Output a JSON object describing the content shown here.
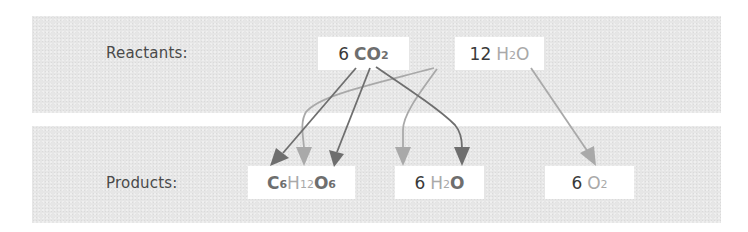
{
  "diagram": {
    "rows": {
      "reactants_label": "Reactants:",
      "products_label": "Products:"
    },
    "reactants": [
      {
        "id": "co2",
        "coefficient": "6",
        "parts": [
          {
            "symbol": "C",
            "sub": "",
            "tone": "dark"
          },
          {
            "symbol": "O",
            "sub": "2",
            "tone": "dark"
          }
        ]
      },
      {
        "id": "h2o",
        "coefficient": "12",
        "parts": [
          {
            "symbol": "H",
            "sub": "2",
            "tone": "light"
          },
          {
            "symbol": "O",
            "sub": "",
            "tone": "light"
          }
        ]
      }
    ],
    "products": [
      {
        "id": "glucose",
        "coefficient": "",
        "parts": [
          {
            "symbol": "C",
            "sub": "6",
            "tone": "dark"
          },
          {
            "symbol": "H",
            "sub": "12",
            "tone": "light"
          },
          {
            "symbol": "O",
            "sub": "6",
            "tone": "dark"
          }
        ]
      },
      {
        "id": "water",
        "coefficient": "6",
        "parts": [
          {
            "symbol": "H",
            "sub": "2",
            "tone": "light"
          },
          {
            "symbol": "O",
            "sub": "",
            "tone": "dark"
          }
        ]
      },
      {
        "id": "oxygen",
        "coefficient": "6",
        "parts": [
          {
            "symbol": "O",
            "sub": "2",
            "tone": "light"
          }
        ]
      }
    ],
    "arrows": [
      {
        "from": "CO2 carbon",
        "to": "C6H12O6 carbon",
        "tone": "dark"
      },
      {
        "from": "CO2 oxygen",
        "to": "C6H12O6 oxygen",
        "tone": "dark"
      },
      {
        "from": "CO2 oxygen",
        "to": "H2O oxygen (product)",
        "tone": "dark"
      },
      {
        "from": "H2O hydrogen",
        "to": "C6H12O6 hydrogen",
        "tone": "light"
      },
      {
        "from": "H2O hydrogen",
        "to": "H2O hydrogen (product)",
        "tone": "light"
      },
      {
        "from": "H2O oxygen",
        "to": "O2",
        "tone": "light"
      }
    ],
    "colors": {
      "dark": "#6e6e6e",
      "light": "#a9a9a9",
      "text": "#3a3a3a",
      "panel": "#e6e6e6"
    }
  }
}
